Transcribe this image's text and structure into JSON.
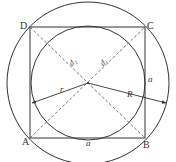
{
  "diagram": {
    "vertices": {
      "A": {
        "label": "A",
        "x": 30,
        "y": 138
      },
      "B": {
        "label": "B",
        "x": 145,
        "y": 138
      },
      "C": {
        "label": "C",
        "x": 145,
        "y": 27
      },
      "D": {
        "label": "D",
        "x": 30,
        "y": 27
      }
    },
    "center": {
      "x": 88,
      "y": 83
    },
    "inner_circle": {
      "cx": 88,
      "cy": 83,
      "r": 57
    },
    "outer_circle": {
      "cx": 88,
      "cy": 83,
      "r": 81
    },
    "labels": {
      "d2": "d₂",
      "d1": "d₁",
      "side_right": "a",
      "side_bottom": "a",
      "inner_radius": "r",
      "outer_radius": "R"
    },
    "colors": {
      "stroke": "#333333",
      "dashed": "#555555",
      "background": "#ffffff"
    }
  }
}
